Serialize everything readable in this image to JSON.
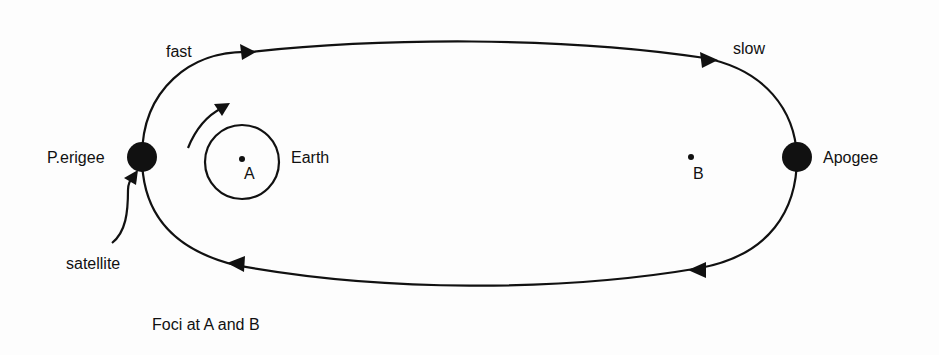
{
  "diagram": {
    "type": "elliptical-orbit",
    "labels": {
      "fast": "fast",
      "slow": "slow",
      "perigee": "P.erigee",
      "apogee": "Apogee",
      "earth": "Earth",
      "focus_a": "A",
      "focus_b": "B",
      "satellite": "satellite",
      "caption": "Foci at A and B"
    },
    "colors": {
      "ink": "#111111",
      "background": "#fdfdfd"
    }
  }
}
